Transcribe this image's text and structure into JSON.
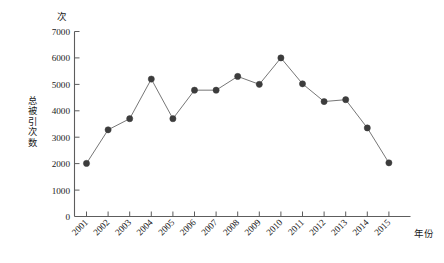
{
  "chart_data": {
    "type": "line",
    "title": "",
    "subtitle": "",
    "xlabel": "年份",
    "ylabel": "总被引次数",
    "yunit": "次",
    "categories": [
      "2001",
      "2002",
      "2003",
      "2004",
      "2005",
      "2006",
      "2007",
      "2008",
      "2009",
      "2010",
      "2011",
      "2012",
      "2013",
      "2014",
      "2015"
    ],
    "values": [
      2010,
      3280,
      3700,
      5200,
      3700,
      4780,
      4780,
      5300,
      5000,
      6000,
      5020,
      4350,
      4420,
      3350,
      2030
    ],
    "series": [
      {
        "name": "总被引次数",
        "values": [
          2010,
          3280,
          3700,
          5200,
          3700,
          4780,
          4780,
          5300,
          5000,
          6000,
          5020,
          4350,
          4420,
          3350,
          2030
        ]
      }
    ],
    "ylim": [
      0,
      7000
    ],
    "yticks": [
      0,
      1000,
      2000,
      3000,
      4000,
      5000,
      6000,
      7000
    ],
    "ytick_labels": [
      "0",
      "1000",
      "2000",
      "3000",
      "4000",
      "5000",
      "6000",
      "7000"
    ],
    "xtick_labels": [
      "2001",
      "2002",
      "2003",
      "2004",
      "2005",
      "2006",
      "2007",
      "2008",
      "2009",
      "2010",
      "2011",
      "2012",
      "2013",
      "2014",
      "2015"
    ],
    "grid": false,
    "legend": false,
    "legend_position": "none",
    "marker": "circle",
    "line_color": "#666666",
    "marker_color": "#3c3c3c",
    "axis_color": "#5d5d5d",
    "background_color": "#ffffff",
    "xtick_rotation_deg": 45
  }
}
